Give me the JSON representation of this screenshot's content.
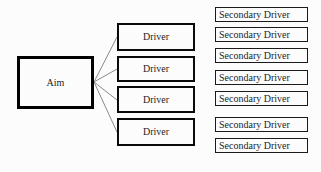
{
  "diagram": {
    "aim": {
      "label": "Aim"
    },
    "drivers": [
      {
        "label": "Driver"
      },
      {
        "label": "Driver"
      },
      {
        "label": "Driver"
      },
      {
        "label": "Driver"
      }
    ],
    "secondary_drivers": [
      {
        "label": "Secondary Driver"
      },
      {
        "label": "Secondary Driver"
      },
      {
        "label": "Secondary Driver"
      },
      {
        "label": "Secondary Driver"
      },
      {
        "label": "Secondary Driver"
      },
      {
        "label": "Secondary Driver"
      },
      {
        "label": "Secondary Driver"
      }
    ],
    "colors": {
      "box_border": "#000000",
      "connector": "#8a8a8a",
      "background": "#fcfcfc"
    }
  }
}
